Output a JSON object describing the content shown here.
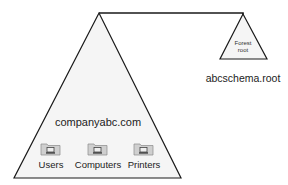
{
  "diagram": {
    "main_domain": {
      "name": "companyabc.com",
      "containers": [
        {
          "label": "Users",
          "icon": "folder-computer-icon"
        },
        {
          "label": "Computers",
          "icon": "folder-computer-icon"
        },
        {
          "label": "Printers",
          "icon": "folder-computer-icon"
        }
      ]
    },
    "forest_root": {
      "inner_label_line1": "Forest",
      "inner_label_line2": "root",
      "name": "abcschema.root"
    },
    "colors": {
      "triangle_fill": "#f4f4f4",
      "stroke": "#1a1a1a",
      "folder_fill": "#c9c9c9"
    }
  }
}
